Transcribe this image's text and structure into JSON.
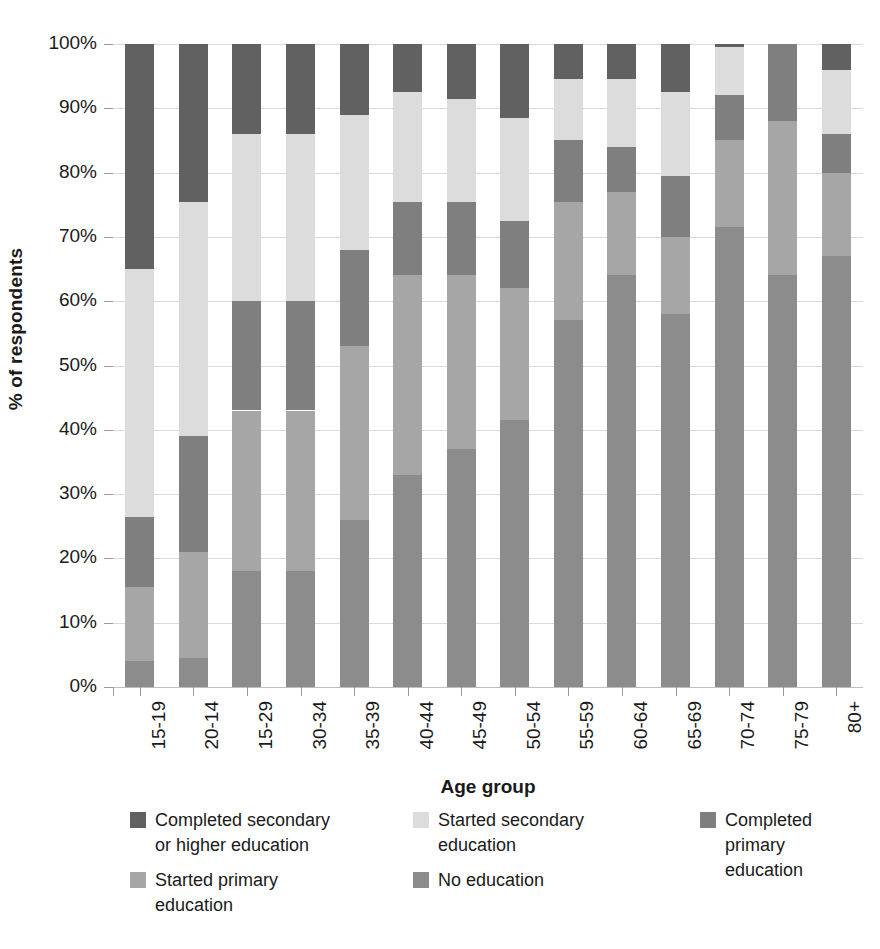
{
  "chart_data": {
    "type": "bar",
    "subtype": "stacked-percent",
    "title": "",
    "xlabel": "Age group",
    "ylabel": "% of respondents",
    "ylim": [
      0,
      100
    ],
    "ytick_labels": [
      "0%",
      "10%",
      "20%",
      "30%",
      "40%",
      "50%",
      "60%",
      "70%",
      "80%",
      "90%",
      "100%"
    ],
    "ytick_values": [
      0,
      10,
      20,
      30,
      40,
      50,
      60,
      70,
      80,
      90,
      100
    ],
    "grid": true,
    "legend_position": "bottom",
    "stack_order_bottom_to_top": [
      "No education",
      "Started primary education",
      "Completed primary education",
      "Started secondary education",
      "Completed secondary or higher education"
    ],
    "categories": [
      "15-19",
      "20-14",
      "15-29",
      "30-34",
      "35-39",
      "40-44",
      "45-49",
      "50-54",
      "55-59",
      "60-64",
      "65-69",
      "70-74",
      "75-79",
      "80+"
    ],
    "series": [
      {
        "name": "No education",
        "color": "#8c8c8c",
        "values": [
          4.0,
          4.5,
          18.0,
          18.0,
          26.0,
          33.0,
          37.0,
          41.5,
          57.0,
          64.0,
          58.0,
          71.5,
          64.0,
          67.0
        ]
      },
      {
        "name": "Started primary education",
        "color": "#a6a6a6",
        "values": [
          11.5,
          16.5,
          25.0,
          25.0,
          27.0,
          31.0,
          27.0,
          20.5,
          18.5,
          13.0,
          12.0,
          13.5,
          24.0,
          13.0
        ]
      },
      {
        "name": "Completed primary education",
        "color": "#7f7f7f",
        "values": [
          11.0,
          18.0,
          17.0,
          17.0,
          15.0,
          11.5,
          11.5,
          10.5,
          9.5,
          7.0,
          9.5,
          7.0,
          12.0,
          6.0
        ]
      },
      {
        "name": "Started secondary education",
        "color": "#dcdcdc",
        "values": [
          38.5,
          36.5,
          26.0,
          26.0,
          21.0,
          17.0,
          16.0,
          16.0,
          9.5,
          10.5,
          13.0,
          7.5,
          0.0,
          10.0
        ]
      },
      {
        "name": "Completed secondary or higher education",
        "color": "#616161",
        "values": [
          35.0,
          24.5,
          14.0,
          14.0,
          11.0,
          7.5,
          8.5,
          11.5,
          5.5,
          5.5,
          7.5,
          0.5,
          0.0,
          4.0
        ]
      }
    ],
    "cumulative_tops": [
      [
        4.0,
        15.5,
        26.5,
        65.0,
        100.0
      ],
      [
        4.5,
        21.0,
        39.0,
        75.5,
        100.0
      ],
      [
        18.0,
        43.0,
        60.0,
        86.0,
        100.0
      ],
      [
        18.0,
        43.0,
        60.0,
        86.0,
        100.0
      ],
      [
        26.0,
        53.0,
        68.0,
        89.0,
        100.0
      ],
      [
        33.0,
        64.0,
        75.5,
        92.5,
        100.0
      ],
      [
        37.0,
        64.0,
        75.5,
        91.5,
        100.0
      ],
      [
        41.5,
        62.0,
        72.5,
        88.5,
        100.0
      ],
      [
        57.0,
        75.5,
        85.0,
        94.5,
        100.0
      ],
      [
        64.0,
        77.0,
        84.0,
        94.5,
        100.0
      ],
      [
        58.0,
        70.0,
        79.5,
        92.5,
        100.0
      ],
      [
        71.5,
        85.0,
        92.0,
        99.5,
        100.0
      ],
      [
        64.0,
        88.0,
        100.0,
        100.0,
        100.0
      ],
      [
        67.0,
        80.0,
        86.0,
        96.0,
        100.0
      ]
    ]
  },
  "legend": {
    "items": [
      {
        "label_line1": "Completed secondary",
        "label_line2": "or higher education",
        "color": "#616161"
      },
      {
        "label_line1": "Started secondary",
        "label_line2": "education",
        "color": "#dcdcdc"
      },
      {
        "label_line1": "Completed primary",
        "label_line2": "education",
        "color": "#7f7f7f"
      },
      {
        "label_line1": "Started primary",
        "label_line2": "education",
        "color": "#a6a6a6"
      },
      {
        "label_line1": "No education",
        "label_line2": "",
        "color": "#8c8c8c"
      }
    ]
  }
}
